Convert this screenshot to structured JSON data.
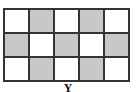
{
  "figure": {
    "label": "Y",
    "rows": 3,
    "cols": 5,
    "colors": {
      "shaded": "#c8c8c8",
      "unshaded": "#ffffff",
      "border": "#333333"
    },
    "cells": [
      [
        0,
        1,
        0,
        1,
        0
      ],
      [
        1,
        0,
        1,
        0,
        1
      ],
      [
        0,
        1,
        0,
        1,
        0
      ]
    ]
  }
}
